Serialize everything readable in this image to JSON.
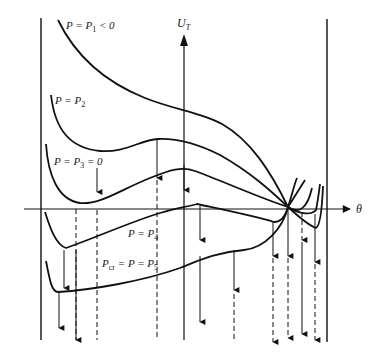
{
  "diagram": {
    "type": "potential-energy-curves",
    "axes": {
      "vertical": {
        "label_main": "U",
        "label_sub": "T"
      },
      "horizontal": {
        "label": "θ"
      }
    },
    "curves": [
      {
        "id": "p1",
        "label_lhs": "P = P",
        "label_sub": "1",
        "label_rhs": " < 0"
      },
      {
        "id": "p2",
        "label_lhs": "P = P",
        "label_sub": "2",
        "label_rhs": ""
      },
      {
        "id": "p3",
        "label_lhs": "P = P",
        "label_sub": "3",
        "label_rhs": " = 0"
      },
      {
        "id": "p4",
        "label_lhs": "P = P",
        "label_sub": "4",
        "label_rhs": ""
      },
      {
        "id": "p5",
        "label_pre": "P",
        "label_pre_sub": "cr",
        "label_lhs": " = P = P",
        "label_sub": "5",
        "label_rhs": ""
      }
    ],
    "colors": {
      "stroke": "#111111",
      "background": "#ffffff"
    }
  }
}
